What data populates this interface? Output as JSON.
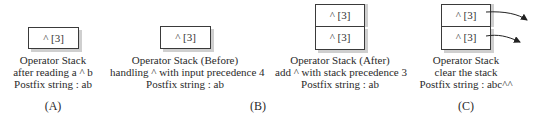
{
  "panels": [
    {
      "id": "A",
      "stack": [
        "^ [3]"
      ],
      "caption": [
        "Operator Stack",
        "after reading a ^ b",
        "Postfix string : ab"
      ],
      "label": "(A)"
    },
    {
      "id": "B-before",
      "stack": [
        "^ [3]"
      ],
      "caption": [
        "Operator Stack (Before)",
        "handling ^ with input precedence 4",
        "Postfix string : ab"
      ]
    },
    {
      "id": "B-after",
      "stack": [
        "^ [3]",
        "^ [3]"
      ],
      "caption": [
        "Operator Stack (After)",
        "add ^ with stack precedence 3",
        "Postfix string : ab"
      ]
    },
    {
      "id": "C",
      "stack": [
        "^ [3]",
        "^ [3]"
      ],
      "caption": [
        "Operator Stack",
        "clear the stack",
        "Postfix string : abc^^"
      ],
      "label": "(C)"
    }
  ],
  "group_label_B": "(B)"
}
